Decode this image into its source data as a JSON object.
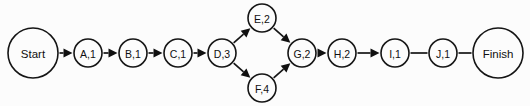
{
  "diagram": {
    "type": "activity-on-node-network",
    "canvas": {
      "width": 530,
      "height": 106,
      "background": "#fcfcfc"
    },
    "style": {
      "line_color": "#151515",
      "text_color": "#101010",
      "node_fill": "#fcfcfc"
    },
    "nodes": [
      {
        "id": "start",
        "label": "Start",
        "cx": 33,
        "cy": 53,
        "r": 25,
        "size": "large"
      },
      {
        "id": "a",
        "label": "A,1",
        "cx": 88,
        "cy": 53,
        "r": 14,
        "size": "small"
      },
      {
        "id": "b",
        "label": "B,1",
        "cx": 133,
        "cy": 53,
        "r": 14,
        "size": "small"
      },
      {
        "id": "c",
        "label": "C,1",
        "cx": 178,
        "cy": 53,
        "r": 14,
        "size": "small"
      },
      {
        "id": "d",
        "label": "D,3",
        "cx": 222,
        "cy": 53,
        "r": 14,
        "size": "small"
      },
      {
        "id": "e",
        "label": "E,2",
        "cx": 262,
        "cy": 18,
        "r": 14,
        "size": "small"
      },
      {
        "id": "f",
        "label": "F,4",
        "cx": 262,
        "cy": 88,
        "r": 14,
        "size": "small"
      },
      {
        "id": "g",
        "label": "G,2",
        "cx": 302,
        "cy": 53,
        "r": 14,
        "size": "small"
      },
      {
        "id": "h",
        "label": "H,2",
        "cx": 342,
        "cy": 53,
        "r": 14,
        "size": "small"
      },
      {
        "id": "i",
        "label": "I,1",
        "cx": 395,
        "cy": 53,
        "r": 14,
        "size": "small"
      },
      {
        "id": "j",
        "label": "J,1",
        "cx": 443,
        "cy": 53,
        "r": 14,
        "size": "small"
      },
      {
        "id": "finish",
        "label": "Finish",
        "cx": 498,
        "cy": 53,
        "r": 25,
        "size": "large"
      }
    ],
    "edges": [
      {
        "from": "start",
        "to": "a",
        "arrow": true
      },
      {
        "from": "a",
        "to": "b",
        "arrow": true
      },
      {
        "from": "b",
        "to": "c",
        "arrow": true
      },
      {
        "from": "c",
        "to": "d",
        "arrow": true
      },
      {
        "from": "d",
        "to": "e",
        "arrow": true
      },
      {
        "from": "d",
        "to": "f",
        "arrow": true
      },
      {
        "from": "e",
        "to": "g",
        "arrow": true
      },
      {
        "from": "f",
        "to": "g",
        "arrow": true
      },
      {
        "from": "g",
        "to": "h",
        "arrow": true
      },
      {
        "from": "h",
        "to": "i",
        "arrow": true
      },
      {
        "from": "i",
        "to": "j",
        "arrow": false
      },
      {
        "from": "j",
        "to": "finish",
        "arrow": false
      }
    ]
  }
}
